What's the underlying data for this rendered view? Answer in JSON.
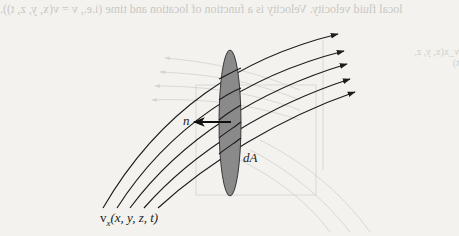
{
  "figure": {
    "type": "fluid-flow-surface-element",
    "surface_label": "dA",
    "normal_label": "n",
    "velocity_label_base": "v",
    "velocity_label_subscript": "x",
    "velocity_label_args": "(x, y, z, t)",
    "streamline_count": 5,
    "colors": {
      "background": "#f3f2ee",
      "ink": "#1c1c1c",
      "surface_fill": "#8a8a8a",
      "bleed": "#cfcec9"
    }
  },
  "bleed_through": {
    "text": "local fluid velocity. Velocity is a function of location and time (i.e., v = v(x, y, z, t)).",
    "ghost_label": "v_x(x, y, z, t)"
  }
}
